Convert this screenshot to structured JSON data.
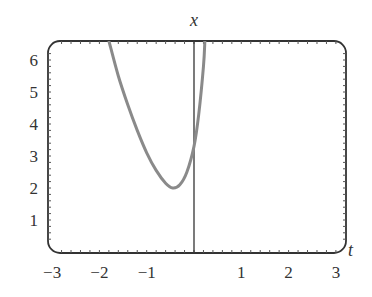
{
  "chart_data": {
    "type": "line",
    "title": "",
    "xlabel": "t",
    "ylabel": "x",
    "xlim": [
      -3,
      3.2
    ],
    "ylim": [
      0,
      6.6
    ],
    "x_ticks": [
      -3,
      -2,
      -1,
      1,
      2,
      3
    ],
    "y_ticks": [
      1,
      2,
      3,
      4,
      5,
      6
    ],
    "x_tick_labels": [
      "−3",
      "−2",
      "−1",
      "1",
      "2",
      "3"
    ],
    "y_tick_labels": [
      "1",
      "2",
      "3",
      "4",
      "5",
      "6"
    ],
    "grid": false,
    "legend": null,
    "series": [
      {
        "name": "solution curve",
        "color": "#8a8a8a",
        "x": [
          -1.8,
          -1.6,
          -1.4,
          -1.2,
          -1.0,
          -0.8,
          -0.6,
          -0.45,
          -0.3,
          -0.15,
          0.0,
          0.1,
          0.2,
          0.23
        ],
        "y": [
          6.6,
          5.5,
          4.6,
          3.8,
          3.1,
          2.55,
          2.15,
          2.0,
          2.1,
          2.5,
          3.3,
          4.3,
          5.8,
          6.6
        ]
      }
    ],
    "vertical_line": {
      "t": 0,
      "color": "#333333"
    }
  },
  "labels": {
    "x_axis_var": "t",
    "y_axis_var": "x"
  }
}
